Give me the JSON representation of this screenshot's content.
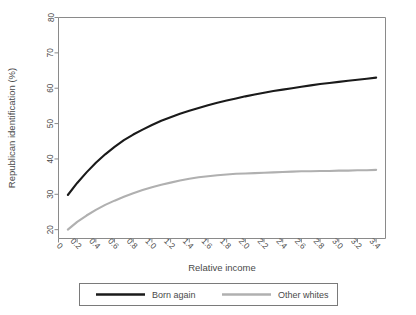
{
  "chart_data": {
    "type": "line",
    "title": "",
    "subtitle": "",
    "xlabel": "Relative income",
    "ylabel": "Republican identification (%)",
    "xlim": [
      0,
      3.5
    ],
    "ylim": [
      17.5,
      80
    ],
    "grid": false,
    "legend_position": "bottom-outside",
    "x_ticks": [
      "0",
      "0.2",
      "0.4",
      "0.6",
      "0.8",
      "1.0",
      "1.2",
      "1.4",
      "1.6",
      "1.8",
      "2.0",
      "2.2",
      "2.4",
      "2.6",
      "2.8",
      "3.0",
      "3.2",
      "3.4"
    ],
    "x_tick_values": [
      0,
      0.2,
      0.4,
      0.6,
      0.8,
      1.0,
      1.2,
      1.4,
      1.6,
      1.8,
      2.0,
      2.2,
      2.4,
      2.6,
      2.8,
      3.0,
      3.2,
      3.4
    ],
    "y_ticks": [
      "20",
      "30",
      "40",
      "50",
      "60",
      "70",
      "80"
    ],
    "y_tick_values": [
      20,
      30,
      40,
      50,
      60,
      70,
      80
    ],
    "x": [
      0.1,
      0.2,
      0.3,
      0.4,
      0.5,
      0.6,
      0.7,
      0.8,
      0.9,
      1.0,
      1.1,
      1.2,
      1.3,
      1.4,
      1.5,
      1.6,
      1.7,
      1.8,
      1.9,
      2.0,
      2.1,
      2.2,
      2.3,
      2.4,
      2.5,
      2.6,
      2.7,
      2.8,
      2.9,
      3.0,
      3.1,
      3.2,
      3.3,
      3.4
    ],
    "series": [
      {
        "name": "Born again",
        "color": "#1a1a1a",
        "width": 2.1,
        "values": [
          29.8,
          33.2,
          36.2,
          38.9,
          41.3,
          43.4,
          45.3,
          46.9,
          48.3,
          49.6,
          50.8,
          51.8,
          52.8,
          53.6,
          54.4,
          55.2,
          55.9,
          56.5,
          57.1,
          57.7,
          58.2,
          58.7,
          59.2,
          59.6,
          60.0,
          60.4,
          60.8,
          61.2,
          61.5,
          61.8,
          62.1,
          62.4,
          62.7,
          63.0
        ]
      },
      {
        "name": "Other whites",
        "color": "#b0b0b0",
        "width": 2.1,
        "values": [
          20.0,
          22.2,
          24.0,
          25.6,
          27.0,
          28.2,
          29.3,
          30.3,
          31.2,
          32.0,
          32.7,
          33.3,
          33.9,
          34.4,
          34.8,
          35.1,
          35.4,
          35.6,
          35.8,
          35.9,
          36.0,
          36.1,
          36.2,
          36.3,
          36.4,
          36.5,
          36.5,
          36.6,
          36.6,
          36.7,
          36.7,
          36.8,
          36.8,
          36.9
        ]
      }
    ]
  },
  "legend": {
    "entries": [
      {
        "label": "Born again",
        "color": "#1a1a1a"
      },
      {
        "label": "Other whites",
        "color": "#b0b0b0"
      }
    ]
  },
  "colors": {
    "born_again": "#1a1a1a",
    "other_whites": "#b0b0b0",
    "axis": "#808080",
    "text": "#4a4a4a",
    "background": "#ffffff"
  }
}
